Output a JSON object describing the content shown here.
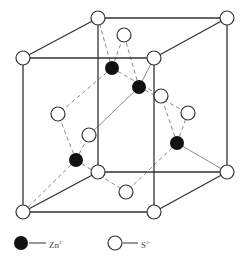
{
  "figure": {
    "colors": {
      "edge": "#333333",
      "bond_solid": "#8a8a8a",
      "bond_dashed": "#8a8a8a",
      "zn_fill": "#111111",
      "s_fill": "#ffffff",
      "s_stroke": "#333333"
    },
    "cube": {
      "front": [
        [
          23,
          58
        ],
        [
          154,
          58
        ],
        [
          154,
          212
        ],
        [
          23,
          212
        ]
      ],
      "back": [
        [
          98,
          18
        ],
        [
          227,
          18
        ],
        [
          227,
          172
        ],
        [
          98,
          172
        ]
      ]
    },
    "s_atoms": [
      {
        "id": "ftl",
        "x": 23,
        "y": 58
      },
      {
        "id": "ftr",
        "x": 154,
        "y": 58
      },
      {
        "id": "fbl",
        "x": 23,
        "y": 212
      },
      {
        "id": "fbr",
        "x": 154,
        "y": 212
      },
      {
        "id": "btl",
        "x": 98,
        "y": 18
      },
      {
        "id": "btr",
        "x": 227,
        "y": 18
      },
      {
        "id": "bbl",
        "x": 98,
        "y": 172
      },
      {
        "id": "bbr",
        "x": 227,
        "y": 172
      },
      {
        "id": "top",
        "x": 124,
        "y": 35
      },
      {
        "id": "left",
        "x": 58,
        "y": 114
      },
      {
        "id": "front",
        "x": 89,
        "y": 135
      },
      {
        "id": "back",
        "x": 161,
        "y": 96
      },
      {
        "id": "right",
        "x": 188,
        "y": 113
      },
      {
        "id": "bottom",
        "x": 126,
        "y": 192
      }
    ],
    "zn_atoms": [
      {
        "id": "zn1",
        "x": 112,
        "y": 68
      },
      {
        "id": "zn2",
        "x": 139,
        "y": 87
      },
      {
        "id": "zn3",
        "x": 76,
        "y": 160
      },
      {
        "id": "zn4",
        "x": 177,
        "y": 143
      }
    ],
    "bonds": [
      {
        "from": "zn1",
        "to": "btl",
        "style": "dashed"
      },
      {
        "from": "zn1",
        "to": "top",
        "style": "dashed"
      },
      {
        "from": "zn1",
        "to": "left",
        "style": "dashed"
      },
      {
        "from": "zn1",
        "to": "back",
        "style": "dashed"
      },
      {
        "from": "zn2",
        "to": "top",
        "style": "dashed"
      },
      {
        "from": "zn2",
        "to": "ftr",
        "style": "solid"
      },
      {
        "from": "zn2",
        "to": "front",
        "style": "solid"
      },
      {
        "from": "zn2",
        "to": "right",
        "style": "dashed"
      },
      {
        "from": "zn3",
        "to": "left",
        "style": "dashed"
      },
      {
        "from": "zn3",
        "to": "front",
        "style": "dashed"
      },
      {
        "from": "zn3",
        "to": "fbl",
        "style": "dashed"
      },
      {
        "from": "zn3",
        "to": "bottom",
        "style": "dashed"
      },
      {
        "from": "zn4",
        "to": "back",
        "style": "dashed"
      },
      {
        "from": "zn4",
        "to": "right",
        "style": "dashed"
      },
      {
        "from": "zn4",
        "to": "bbr",
        "style": "solid"
      },
      {
        "from": "zn4",
        "to": "bottom",
        "style": "dashed"
      }
    ],
    "atom_radius": 7
  },
  "legend": {
    "zn": {
      "symbol": "Zn",
      "charge": "2+",
      "x": 21,
      "y": 243,
      "line": [
        29,
        46
      ]
    },
    "s": {
      "symbol": "S",
      "charge": "2−",
      "x": 115,
      "y": 243,
      "line": [
        123,
        138
      ]
    }
  },
  "caption": "Figure: Zinc blende structure"
}
